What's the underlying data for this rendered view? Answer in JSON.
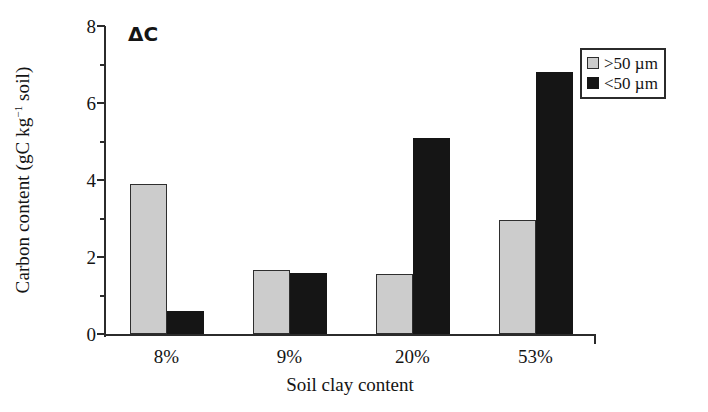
{
  "chart_data": {
    "type": "bar",
    "title": "",
    "annotation": "ΔC",
    "xlabel": "Soil clay content",
    "ylabel_parts": {
      "pre": "Carbon content (gC kg",
      "sup": "−1",
      "post": " soil)"
    },
    "ylabel": "Carbon content (gC kg−1 soil)",
    "categories": [
      "8%",
      "9%",
      "20%",
      "53%"
    ],
    "series": [
      {
        "name": ">50 µm",
        "color": "#cccccc",
        "values": [
          3.9,
          1.65,
          1.55,
          2.95
        ]
      },
      {
        "name": "<50 µm",
        "color": "#151515",
        "values": [
          0.6,
          1.58,
          5.1,
          6.8
        ]
      }
    ],
    "ylim": [
      0,
      8
    ],
    "yticks_major": [
      0,
      2,
      4,
      6,
      8
    ],
    "yticks_minor": [
      1,
      3,
      5,
      7
    ],
    "ytick_labels": [
      "0",
      "2",
      "4",
      "6",
      "8"
    ],
    "grid": false,
    "legend_position": "top-right"
  },
  "legend": {
    "entries": [
      {
        "label": ">50 µm",
        "swatch": "gray"
      },
      {
        "label": "<50 µm",
        "swatch": "black"
      }
    ]
  },
  "colors": {
    "coarse_fraction": "#cccccc",
    "fine_fraction": "#151515",
    "axis": "#2b2b2b",
    "text": "#141414",
    "background": "#ffffff"
  }
}
